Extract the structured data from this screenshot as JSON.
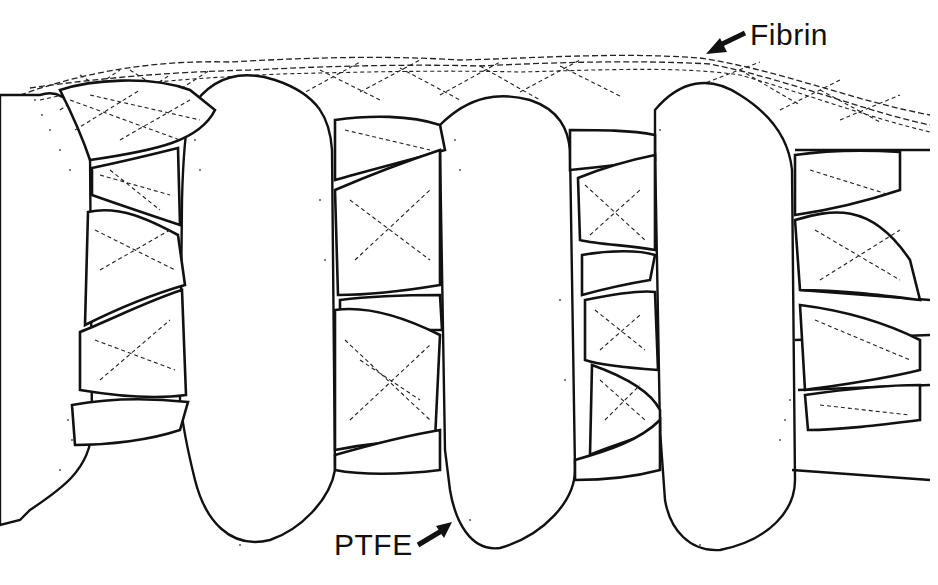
{
  "figure": {
    "type": "schematic line drawing",
    "labels": {
      "fibrin": "Fibrin",
      "ptfe": "PTFE"
    },
    "arrows": [
      {
        "target": "fibrin",
        "direction": "down-left"
      },
      {
        "target": "ptfe",
        "direction": "up-right"
      }
    ],
    "colors": {
      "line": "#111111",
      "background": "#ffffff"
    }
  }
}
